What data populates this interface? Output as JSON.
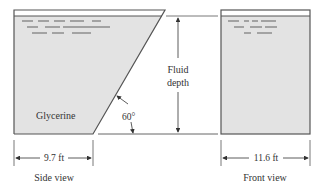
{
  "side_view": {
    "caption": "Side view",
    "fluid_label": "Glycerine",
    "width_label": "9.7 ft",
    "angle_label": "60°"
  },
  "front_view": {
    "caption": "Front view",
    "width_label": "11.6 ft"
  },
  "depth_label": {
    "line1": "Fluid",
    "line2": "depth"
  },
  "colors": {
    "fluid_fill": "#e3e3e3",
    "outline": "#555555",
    "text": "#333333"
  }
}
